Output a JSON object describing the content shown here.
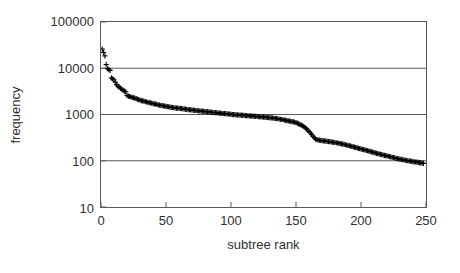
{
  "chart_data": {
    "type": "scatter",
    "title": "",
    "xlabel": "subtree rank",
    "ylabel": "frequency",
    "xlim": [
      0,
      250
    ],
    "ylim": [
      10,
      100000
    ],
    "yscale": "log",
    "xscale": "linear",
    "grid": true,
    "grid_axis": "y",
    "legend": false,
    "marker": "plus",
    "marker_color": "#000000",
    "xticks": [
      0,
      50,
      100,
      150,
      200,
      250
    ],
    "xtick_labels": [
      "0",
      "50",
      "100",
      "150",
      "200",
      "250"
    ],
    "yticks": [
      10,
      100,
      1000,
      10000,
      100000
    ],
    "ytick_labels": [
      "10",
      "100",
      "1000",
      "10000",
      "100000"
    ],
    "series": [
      {
        "name": "subtree frequency",
        "x": [
          1,
          2,
          3,
          4,
          5,
          6,
          7,
          8,
          9,
          10,
          11,
          12,
          13,
          14,
          15,
          16,
          17,
          18,
          19,
          20,
          21,
          22,
          23,
          24,
          25,
          26,
          27,
          28,
          29,
          30,
          31,
          32,
          33,
          34,
          35,
          36,
          37,
          38,
          39,
          40,
          41,
          42,
          43,
          44,
          45,
          46,
          47,
          48,
          49,
          50,
          51,
          52,
          53,
          54,
          55,
          56,
          57,
          58,
          59,
          60,
          61,
          62,
          63,
          64,
          65,
          66,
          67,
          68,
          69,
          70,
          71,
          72,
          73,
          74,
          75,
          76,
          77,
          78,
          79,
          80,
          81,
          82,
          83,
          84,
          85,
          86,
          87,
          88,
          89,
          90,
          91,
          92,
          93,
          94,
          95,
          96,
          97,
          98,
          99,
          100,
          101,
          102,
          103,
          104,
          105,
          106,
          107,
          108,
          109,
          110,
          111,
          112,
          113,
          114,
          115,
          116,
          117,
          118,
          119,
          120,
          121,
          122,
          123,
          124,
          125,
          126,
          127,
          128,
          129,
          130,
          131,
          132,
          133,
          134,
          135,
          136,
          137,
          138,
          139,
          140,
          141,
          142,
          143,
          144,
          145,
          146,
          147,
          148,
          149,
          150,
          151,
          152,
          153,
          154,
          155,
          156,
          157,
          158,
          159,
          160,
          161,
          162,
          163,
          164,
          165,
          166,
          167,
          168,
          169,
          170,
          171,
          172,
          173,
          174,
          175,
          176,
          177,
          178,
          179,
          180,
          181,
          182,
          183,
          184,
          185,
          186,
          187,
          188,
          189,
          190,
          191,
          192,
          193,
          194,
          195,
          196,
          197,
          198,
          199,
          200,
          201,
          202,
          203,
          204,
          205,
          206,
          207,
          208,
          209,
          210,
          211,
          212,
          213,
          214,
          215,
          216,
          217,
          218,
          219,
          220,
          221,
          222,
          223,
          224,
          225,
          226,
          227,
          228,
          229,
          230,
          231,
          232,
          233,
          234,
          235,
          236,
          237,
          238,
          239,
          240,
          241,
          242,
          243,
          244,
          245,
          246,
          247,
          248
        ],
        "y": [
          26000,
          22000,
          18500,
          12000,
          9800,
          9300,
          9000,
          6200,
          5900,
          5600,
          5000,
          4400,
          4100,
          3900,
          3700,
          3500,
          3350,
          3200,
          3100,
          2600,
          2500,
          2450,
          2400,
          2350,
          2300,
          2250,
          2200,
          2150,
          2100,
          2050,
          2000,
          1980,
          1950,
          1900,
          1870,
          1840,
          1800,
          1780,
          1750,
          1720,
          1700,
          1680,
          1650,
          1620,
          1600,
          1580,
          1560,
          1540,
          1520,
          1500,
          1480,
          1470,
          1450,
          1430,
          1420,
          1400,
          1390,
          1380,
          1370,
          1360,
          1350,
          1340,
          1330,
          1320,
          1300,
          1290,
          1280,
          1270,
          1260,
          1250,
          1240,
          1230,
          1220,
          1210,
          1200,
          1190,
          1185,
          1180,
          1170,
          1160,
          1150,
          1145,
          1140,
          1130,
          1120,
          1110,
          1100,
          1095,
          1090,
          1080,
          1070,
          1065,
          1060,
          1050,
          1045,
          1040,
          1030,
          1025,
          1020,
          1010,
          1000,
          995,
          990,
          985,
          980,
          975,
          970,
          965,
          960,
          955,
          950,
          945,
          940,
          935,
          930,
          925,
          920,
          915,
          910,
          905,
          900,
          895,
          890,
          885,
          880,
          875,
          870,
          865,
          860,
          855,
          845,
          840,
          830,
          825,
          815,
          810,
          800,
          790,
          780,
          770,
          760,
          750,
          740,
          730,
          720,
          710,
          700,
          690,
          680,
          670,
          650,
          630,
          610,
          590,
          570,
          550,
          520,
          490,
          460,
          430,
          400,
          370,
          340,
          315,
          295,
          285,
          280,
          278,
          275,
          272,
          270,
          268,
          265,
          262,
          260,
          258,
          255,
          252,
          250,
          248,
          245,
          242,
          238,
          235,
          232,
          228,
          225,
          222,
          218,
          215,
          212,
          208,
          205,
          200,
          197,
          193,
          190,
          186,
          183,
          180,
          177,
          174,
          171,
          168,
          165,
          162,
          159,
          156,
          153,
          150,
          148,
          145,
          143,
          140,
          138,
          135,
          133,
          131,
          129,
          127,
          125,
          123,
          121,
          119,
          117,
          115,
          113,
          111,
          110,
          108,
          107,
          105,
          104,
          103,
          101,
          100,
          99,
          98,
          97,
          96,
          95,
          94,
          93,
          92,
          91,
          90,
          89,
          88
        ]
      }
    ]
  }
}
